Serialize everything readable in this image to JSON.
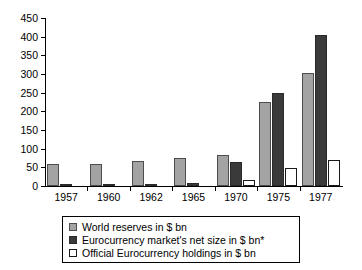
{
  "chart_data": {
    "type": "bar",
    "title": "",
    "xlabel": "",
    "ylabel": "",
    "ylim": [
      0,
      450
    ],
    "ytick_step": 50,
    "yticks": [
      0,
      50,
      100,
      150,
      200,
      250,
      300,
      350,
      400,
      450
    ],
    "grid": false,
    "legend_position": "bottom",
    "categories": [
      "1957",
      "1960",
      "1962",
      "1965",
      "1970",
      "1975",
      "1977"
    ],
    "series": [
      {
        "name": "World reserves in $ bn",
        "color": "#a3a3a3",
        "values": [
          58,
          59,
          67,
          74,
          82,
          225,
          303
        ]
      },
      {
        "name": "Eurocurrency market's net size in $ bn*",
        "color": "#3a3a3a",
        "values": [
          1,
          1,
          4,
          9,
          63,
          250,
          405
        ]
      },
      {
        "name": "Official Eurocurrency holdings in $ bn",
        "color": "#ffffff",
        "values": [
          0,
          0,
          0,
          0,
          15,
          49,
          70
        ]
      }
    ]
  },
  "legend": {
    "items": [
      {
        "label": "World reserves in $ bn",
        "swatch": "gray-filled-swatch"
      },
      {
        "label": "Eurocurrency market's net size in $ bn*",
        "swatch": "dark-filled-swatch"
      },
      {
        "label": "Official Eurocurrency holdings in $ bn",
        "swatch": "white-outlined-swatch"
      }
    ]
  }
}
